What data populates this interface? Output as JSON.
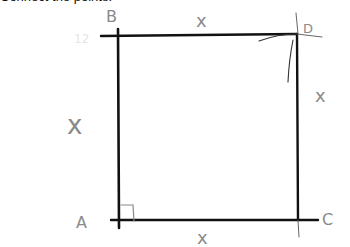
{
  "caption": "Connect the points.",
  "diagram": {
    "shape": "square",
    "vertices": {
      "A": {
        "label": "A"
      },
      "B": {
        "label": "B"
      },
      "C": {
        "label": "C"
      },
      "D": {
        "label": "D"
      }
    },
    "side_labels": {
      "top": "x",
      "left": "x",
      "right": "x",
      "bottom": "x"
    },
    "right_angle_marker": "A",
    "faint_note": "12",
    "colors": {
      "lines": "#111111",
      "annotations": "#8a8a8a"
    }
  }
}
